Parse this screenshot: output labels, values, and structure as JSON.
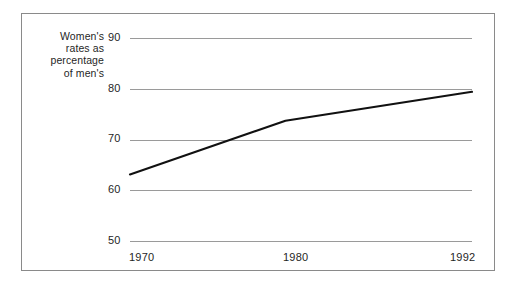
{
  "chart_data": {
    "type": "line",
    "title": "",
    "subtitle": "",
    "xlabel": "",
    "ylabel": "Women's rates as percentage of men's",
    "ylabel_lines": [
      "Women's",
      "rates as",
      "percentage",
      "of men's"
    ],
    "x": [
      1970,
      1980,
      1992
    ],
    "values": [
      63.1,
      73.7,
      79.4
    ],
    "series": [
      {
        "name": "Women's rates as percentage of men's",
        "values": [
          63.1,
          73.7,
          79.4
        ],
        "color": "#111111"
      }
    ],
    "x_tick_labels": [
      "1970",
      "1980",
      "1992"
    ],
    "y_tick_labels": [
      "90",
      "80",
      "70",
      "60",
      "50"
    ],
    "y_ticks": [
      90,
      80,
      70,
      60,
      50
    ],
    "xlim": [
      1970,
      1992
    ],
    "ylim": [
      50,
      90
    ],
    "grid": "horizontal",
    "gridline_color": "#9a9a9a",
    "legend": "none",
    "frame_color": "#8a8a8a",
    "background_color": "#ffffff",
    "annotations": []
  },
  "figure": {
    "border_color": "#8a8a8a"
  }
}
